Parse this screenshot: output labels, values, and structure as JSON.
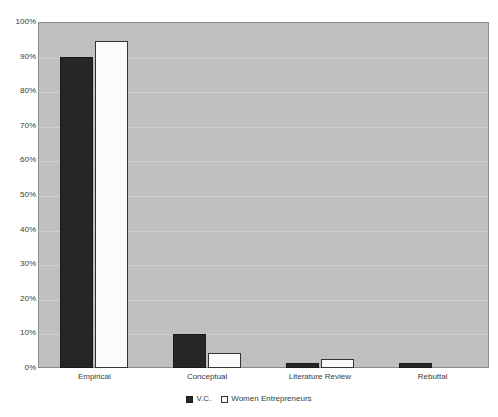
{
  "chart_data": {
    "type": "bar",
    "title": "",
    "subtitle": "",
    "xlabel": "",
    "ylabel": "",
    "ylim": [
      0,
      100
    ],
    "y_tick_labels": [
      "0%",
      "10%",
      "20%",
      "30%",
      "40%",
      "50%",
      "60%",
      "70%",
      "80%",
      "90%",
      "100%"
    ],
    "y_tick_values": [
      0,
      10,
      20,
      30,
      40,
      50,
      60,
      70,
      80,
      90,
      100
    ],
    "grid": true,
    "legend_position": "bottom-center",
    "categories": [
      "Empirical",
      "Conceptual",
      "Literature Review",
      "Rebuttal"
    ],
    "series": [
      {
        "name": "V.C.",
        "color": "#262626",
        "values": [
          90,
          9.8,
          1.4,
          1.4
        ]
      },
      {
        "name": "Women Entrepreneurs",
        "color": "#ffffff",
        "values": [
          94.5,
          4.3,
          2.6,
          0
        ]
      }
    ],
    "plot_background_color": "#c0c0c0",
    "page_background_color": "#ffffff"
  }
}
